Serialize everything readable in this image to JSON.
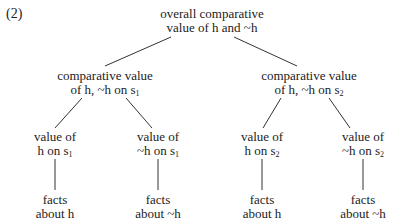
{
  "figure": {
    "number": "(2)",
    "nodes": {
      "root": {
        "line1": "overall comparative",
        "line2": "value of h and ~h"
      },
      "mid_left": {
        "line1": "comparative value",
        "line2_pre": "of h, ~h on s",
        "sub": "1"
      },
      "mid_right": {
        "line1": "comparative value",
        "line2_pre": "of h, ~h on s",
        "sub": "2"
      },
      "leaf1": {
        "line1": "value of",
        "line2_pre": "h on s",
        "sub": "1"
      },
      "leaf2": {
        "line1": "value of",
        "line2_pre": "~h on s",
        "sub": "1"
      },
      "leaf3": {
        "line1": "value of",
        "line2_pre": "h on s",
        "sub": "2"
      },
      "leaf4": {
        "line1": "value of",
        "line2_pre": "~h on s",
        "sub": "2"
      },
      "fact1": {
        "line1": "facts",
        "line2": "about h"
      },
      "fact2": {
        "line1": "facts",
        "line2": "about ~h"
      },
      "fact3": {
        "line1": "facts",
        "line2": "about h"
      },
      "fact4": {
        "line1": "facts",
        "line2": "about ~h"
      }
    }
  }
}
